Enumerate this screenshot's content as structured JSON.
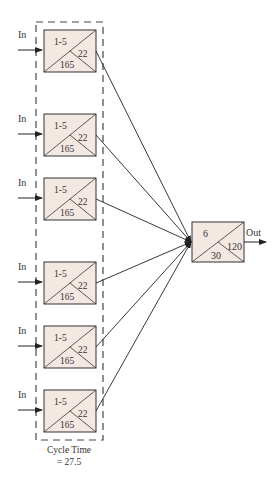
{
  "diagram": {
    "input_label": "In",
    "output_label": "Out",
    "colors": {
      "box_fill": "#f3e8e2",
      "stroke": "#333333"
    },
    "parallel_stations": [
      {
        "top": "1-5",
        "right": "22",
        "bottom": "165",
        "y": 30
      },
      {
        "top": "1-5",
        "right": "22",
        "bottom": "165",
        "y": 114
      },
      {
        "top": "1-5",
        "right": "22",
        "bottom": "165",
        "y": 178
      },
      {
        "top": "1-5",
        "right": "22",
        "bottom": "165",
        "y": 262
      },
      {
        "top": "1-5",
        "right": "22",
        "bottom": "165",
        "y": 326
      },
      {
        "top": "1-5",
        "right": "22",
        "bottom": "165",
        "y": 390
      }
    ],
    "output_station": {
      "top": "6",
      "right": "120",
      "bottom": "30"
    },
    "caption_line1": "Cycle Time",
    "caption_line2": "= 27.5"
  }
}
